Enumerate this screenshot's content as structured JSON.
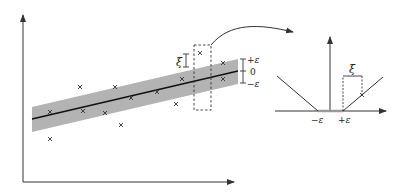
{
  "diagram": {
    "left_plot": {
      "labels": {
        "plus_eps": "+ε",
        "zero": "0",
        "minus_eps": "−ε",
        "slack": "ξ"
      },
      "band_color": "#b3b3b3",
      "points": [
        [
          50,
          112
        ],
        [
          50,
          139
        ],
        [
          80,
          87
        ],
        [
          83,
          111
        ],
        [
          105,
          113
        ],
        [
          115,
          87
        ],
        [
          121,
          125
        ],
        [
          131,
          98
        ],
        [
          157,
          92
        ],
        [
          176,
          104
        ],
        [
          182,
          79
        ],
        [
          200,
          53
        ],
        [
          223,
          63
        ],
        [
          223,
          79
        ]
      ]
    },
    "right_plot": {
      "labels": {
        "minus_eps": "−ε",
        "plus_eps": "+ε",
        "slack": "ξ"
      }
    },
    "arrow": "curved-arrow-to-loss-plot"
  }
}
